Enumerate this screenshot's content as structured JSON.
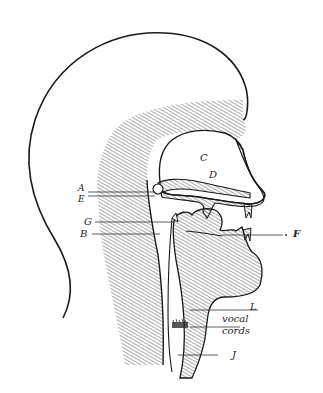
{
  "diagram": {
    "style": {
      "ink": "#1a1a1a",
      "hatch": "#555555",
      "background": "#ffffff"
    },
    "labels": {
      "A": "A",
      "E": "E",
      "G": "G",
      "B": "B",
      "C": "C",
      "D": "D",
      "F": "F",
      "L": "L",
      "vocal": "vocal",
      "cords": "cords",
      "J": "J"
    }
  }
}
